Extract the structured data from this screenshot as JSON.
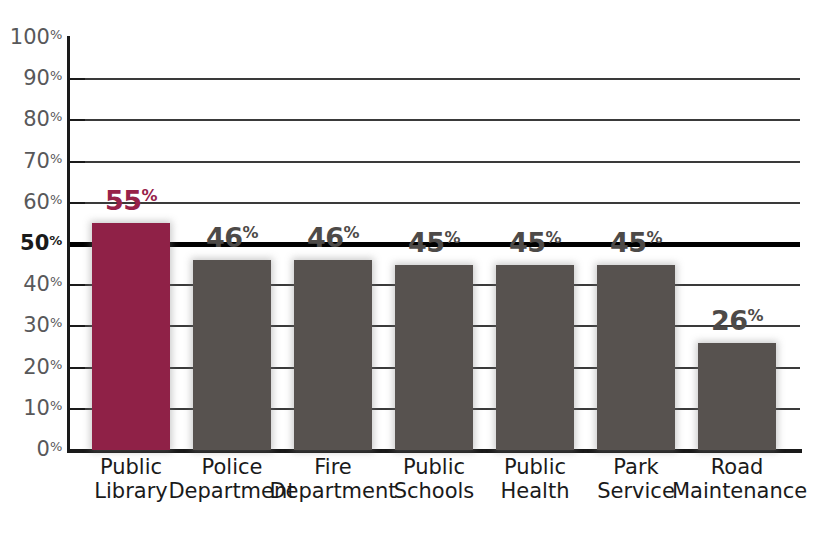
{
  "chart_data": {
    "type": "bar",
    "title": "",
    "subtitle": "",
    "xlabel": "",
    "ylabel": "",
    "ylim": [
      0,
      100
    ],
    "y_unit": "%",
    "grid": true,
    "legend": "none",
    "gridline_values": [
      90,
      80,
      70,
      60,
      50,
      40,
      30,
      20,
      10
    ],
    "emphasis_gridline": 50,
    "y_ticks": [
      {
        "value": 100,
        "label": "100",
        "suffix": "%",
        "bold": false
      },
      {
        "value": 90,
        "label": "90",
        "suffix": "%",
        "bold": false
      },
      {
        "value": 80,
        "label": "80",
        "suffix": "%",
        "bold": false
      },
      {
        "value": 70,
        "label": "70",
        "suffix": "%",
        "bold": false
      },
      {
        "value": 60,
        "label": "60",
        "suffix": "%",
        "bold": false
      },
      {
        "value": 50,
        "label": "50",
        "suffix": "%",
        "bold": true
      },
      {
        "value": 40,
        "label": "40",
        "suffix": "%",
        "bold": false
      },
      {
        "value": 30,
        "label": "30",
        "suffix": "%",
        "bold": false
      },
      {
        "value": 20,
        "label": "20",
        "suffix": "%",
        "bold": false
      },
      {
        "value": 10,
        "label": "10",
        "suffix": "%",
        "bold": false
      },
      {
        "value": 0,
        "label": "0",
        "suffix": "%",
        "bold": false
      }
    ],
    "categories": [
      "Public Library",
      "Police Department",
      "Fire Department",
      "Public Schools",
      "Public Health",
      "Park Service",
      "Road Maintenance"
    ],
    "category_lines": [
      [
        "Public",
        "Library"
      ],
      [
        "Police",
        "Department"
      ],
      [
        "Fire",
        "Department"
      ],
      [
        "Public",
        "Schools"
      ],
      [
        "Public",
        "Health"
      ],
      [
        "Park",
        "Service"
      ],
      [
        "Road",
        "Maintenance"
      ]
    ],
    "values": [
      55,
      46,
      46,
      45,
      45,
      45,
      26
    ],
    "value_labels": [
      "55",
      "46",
      "46",
      "45",
      "45",
      "45",
      "26"
    ],
    "value_suffix": "%",
    "bar_colors": [
      "#8f2147",
      "#57524f",
      "#57524f",
      "#57524f",
      "#57524f",
      "#57524f",
      "#57524f"
    ],
    "label_colors": [
      "#97224a",
      "#4d4a48",
      "#4d4a48",
      "#4d4a48",
      "#4d4a48",
      "#4d4a48",
      "#4d4a48"
    ],
    "highlight_index": 0,
    "colors": {
      "highlight": "#8f2147",
      "default_bar": "#57524f",
      "axis": "#1a1a1a",
      "gridline": "#3a3a3a",
      "tick_label": "#58585a",
      "background": "#ffffff"
    }
  }
}
